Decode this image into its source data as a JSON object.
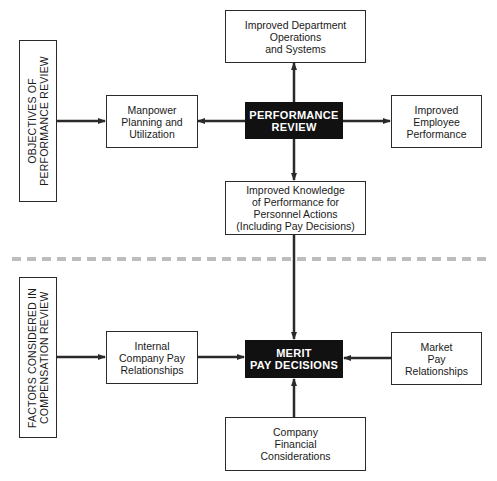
{
  "diagram": {
    "top_section": {
      "side_label": "OBJECTIVES OF\nPERFORMANCE REVIEW",
      "center": "PERFORMANCE\nREVIEW",
      "top": "Improved Department\nOperations\nand Systems",
      "left": "Manpower\nPlanning and\nUtilization",
      "right": "Improved\nEmployee\nPerformance",
      "bottom": "Improved Knowledge\nof Performance for\nPersonnel Actions\n(Including Pay Decisions)"
    },
    "bottom_section": {
      "side_label": "FACTORS CONSIDERED IN\nCOMPENSATION REVIEW",
      "center": "MERIT\nPAY DECISIONS",
      "left": "Internal\nCompany Pay\nRelationships",
      "right": "Market\nPay\nRelationships",
      "bottom": "Company\nFinancial\nConsiderations"
    },
    "colors": {
      "line": "#2a2a2a",
      "center_fill": "#111111",
      "divider": "#bdbdbd"
    }
  }
}
